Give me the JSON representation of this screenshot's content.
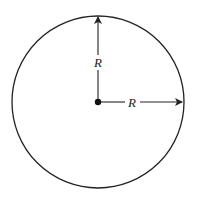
{
  "diagram": {
    "title": "",
    "shape": "circle",
    "center": {
      "x": 98,
      "y": 102
    },
    "radius_px": 86,
    "vertical_radius_label": "R",
    "horizontal_radius_label": "R",
    "colors": {
      "stroke": "#222222",
      "background": "#ffffff"
    }
  }
}
